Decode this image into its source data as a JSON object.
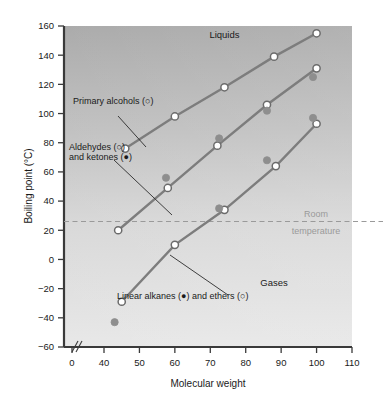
{
  "chart_data": {
    "type": "scatter",
    "title": "",
    "xlabel": "Molecular weight",
    "ylabel": "Boiling point (°C)",
    "xlim": [
      0,
      110
    ],
    "ylim": [
      -60,
      160
    ],
    "x_axis_break": true,
    "x_break_after": 0,
    "x_ticks": [
      0,
      40,
      50,
      60,
      70,
      80,
      90,
      100,
      110
    ],
    "y_ticks": [
      -60,
      -40,
      -20,
      0,
      20,
      40,
      60,
      80,
      100,
      120,
      140,
      160
    ],
    "grid": false,
    "legend_position": "inline-annotations",
    "zone_labels": [
      {
        "text": "Liquids",
        "x": 74,
        "y": 152
      },
      {
        "text": "Gases",
        "x": 88,
        "y": -18
      }
    ],
    "reference_line": {
      "label_line1": "Room",
      "label_line2": "temperature",
      "value": 26,
      "style": "dashed",
      "color": "#9a9a9a"
    },
    "annotations": [
      {
        "text": "Primary alcohols (○)",
        "x": 47.5,
        "y": 112
      },
      {
        "text": "Aldehydes (○)",
        "x": 44.5,
        "y": 66
      },
      {
        "text": "and ketones (●)",
        "x": 44.5,
        "y": 57
      },
      {
        "text": "Linear alkanes (●) and ethers (○)",
        "x": 54,
        "y": -43
      }
    ],
    "series": [
      {
        "name": "Primary alcohols",
        "marker": "open-circle",
        "color": "#6b6b6b",
        "fill": "#ffffff",
        "line": true,
        "points": [
          {
            "x": 46,
            "y": 76
          },
          {
            "x": 60,
            "y": 98
          },
          {
            "x": 74,
            "y": 118
          },
          {
            "x": 88,
            "y": 139
          },
          {
            "x": 100,
            "y": 155
          }
        ]
      },
      {
        "name": "Aldehydes",
        "marker": "open-circle",
        "color": "#6b6b6b",
        "fill": "#ffffff",
        "line": true,
        "points": [
          {
            "x": 44,
            "y": 20
          },
          {
            "x": 58,
            "y": 49
          },
          {
            "x": 72,
            "y": 78
          },
          {
            "x": 86,
            "y": 106
          },
          {
            "x": 100,
            "y": 131
          }
        ]
      },
      {
        "name": "Ketones",
        "marker": "filled-circle",
        "color": "#8e8e8e",
        "fill": "#8e8e8e",
        "line": false,
        "points": [
          {
            "x": 57.5,
            "y": 56
          },
          {
            "x": 72.5,
            "y": 83
          },
          {
            "x": 86,
            "y": 102
          },
          {
            "x": 99,
            "y": 125
          }
        ]
      },
      {
        "name": "Ethers",
        "marker": "open-circle",
        "color": "#6b6b6b",
        "fill": "#ffffff",
        "line": true,
        "points": [
          {
            "x": 45,
            "y": -29
          },
          {
            "x": 60,
            "y": 10
          },
          {
            "x": 74,
            "y": 34
          },
          {
            "x": 88.5,
            "y": 64
          },
          {
            "x": 100,
            "y": 93
          }
        ]
      },
      {
        "name": "Linear alkanes",
        "marker": "filled-circle",
        "color": "#8e8e8e",
        "fill": "#8e8e8e",
        "line": false,
        "points": [
          {
            "x": 43,
            "y": -43
          },
          {
            "x": 72.5,
            "y": 35
          },
          {
            "x": 86,
            "y": 68
          },
          {
            "x": 99,
            "y": 97
          }
        ]
      }
    ]
  },
  "axis": {
    "y_label": "Boiling point (°C)",
    "x_label": "Molecular weight",
    "break_glyph": "//"
  },
  "colors": {
    "axis": "#3a3a3a",
    "text": "#1a1a1a",
    "line": "#7d7d7d",
    "marker_open_stroke": "#6b6b6b",
    "marker_filled": "#8e8e8e",
    "room_temp": "#9a9a9a",
    "plot_bg_top": "#a8a8a8",
    "plot_bg_bottom": "#e4e4e4"
  }
}
